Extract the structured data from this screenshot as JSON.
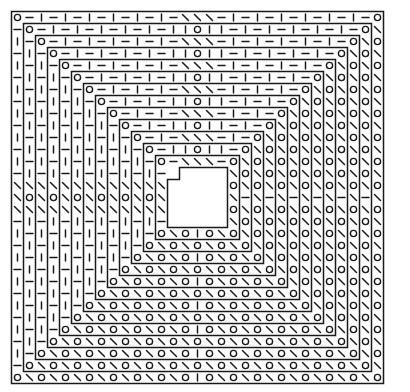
{
  "diagram": {
    "type": "square-spiral-symbol-chart",
    "colors": {
      "ink": "#1a1a1a",
      "paper": "#ffffff"
    },
    "grid": {
      "origin_x": 11.5,
      "origin_y": 11.5,
      "cell": 12,
      "size": 31
    },
    "symbols": {
      "O": "circle (yarn-over)",
      "|": "vertical bar (knit)",
      "-": "horizontal dash (purl)",
      "\\": "diagonal (decrease)"
    },
    "rings": 13,
    "center_hole": {
      "cells": 3,
      "notched": true
    }
  }
}
